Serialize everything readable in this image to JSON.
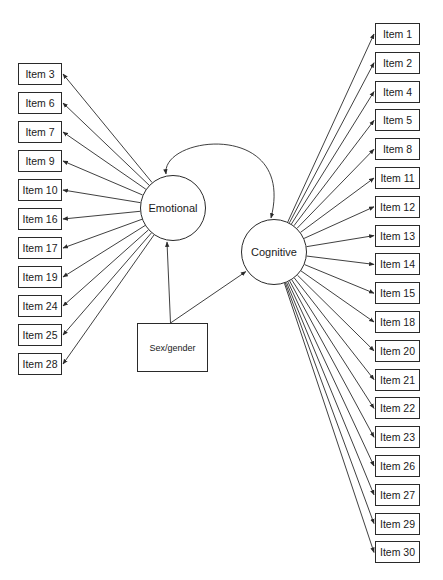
{
  "diagram": {
    "type": "structural-equation-model",
    "factors": [
      {
        "id": "emotional",
        "label": "Emotional",
        "cx": 173,
        "cy": 208,
        "r": 33
      },
      {
        "id": "cognitive",
        "label": "Cognitive",
        "cx": 274,
        "cy": 252,
        "r": 33
      }
    ],
    "covariate": {
      "id": "sexgender",
      "label": "Sex/gender",
      "x": 137,
      "y": 323,
      "w": 71,
      "h": 49
    },
    "emotional_items": [
      {
        "label": "Item 3"
      },
      {
        "label": "Item 6"
      },
      {
        "label": "Item 7"
      },
      {
        "label": "Item 9"
      },
      {
        "label": "Item 10"
      },
      {
        "label": "Item 16"
      },
      {
        "label": "Item 17"
      },
      {
        "label": "Item 19"
      },
      {
        "label": "Item 24"
      },
      {
        "label": "Item 25"
      },
      {
        "label": "Item 28"
      }
    ],
    "cognitive_items": [
      {
        "label": "Item 1"
      },
      {
        "label": "Item 2"
      },
      {
        "label": "Item 4"
      },
      {
        "label": "Item 5"
      },
      {
        "label": "Item 8"
      },
      {
        "label": "Item 11"
      },
      {
        "label": "Item 12"
      },
      {
        "label": "Item 13"
      },
      {
        "label": "Item 14"
      },
      {
        "label": "Item 15"
      },
      {
        "label": "Item 18"
      },
      {
        "label": "Item 20"
      },
      {
        "label": "Item 21"
      },
      {
        "label": "Item 22"
      },
      {
        "label": "Item 23"
      },
      {
        "label": "Item 26"
      },
      {
        "label": "Item 27"
      },
      {
        "label": "Item 29"
      },
      {
        "label": "Item 30"
      }
    ],
    "layout": {
      "left_box": {
        "x": 18,
        "w": 44,
        "h": 22,
        "top": 63,
        "step": 29
      },
      "right_box": {
        "x": 375,
        "w": 45,
        "h": 22,
        "top": 23,
        "step": 28.8
      }
    },
    "colors": {
      "line": "#2a2a2a",
      "background": "#ffffff"
    }
  }
}
